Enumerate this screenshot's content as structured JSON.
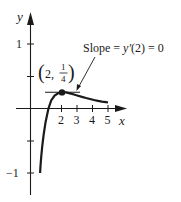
{
  "diagram": {
    "type": "function-graph",
    "function": "y = (x - 1) / x^2",
    "axes": {
      "x_label": "x",
      "y_label": "y",
      "x_ticks": [
        {
          "value": 2,
          "label": "2"
        },
        {
          "value": 3,
          "label": "3"
        },
        {
          "value": 4,
          "label": "4"
        },
        {
          "value": 5,
          "label": "5"
        }
      ],
      "y_ticks": [
        {
          "value": 1,
          "label": "1"
        },
        {
          "value": 0.5,
          "label": ""
        },
        {
          "value": -0.5,
          "label": ""
        },
        {
          "value": -1,
          "label": "−1"
        }
      ],
      "x_range": [
        0,
        5.9
      ],
      "y_range": [
        -1.3,
        1.35
      ]
    },
    "point": {
      "x": 2,
      "y": 0.25,
      "label_prefix": "(2, ",
      "label_num": "1",
      "label_den": "4",
      "label_suffix": ")"
    },
    "annotation": {
      "text_pre": "Slope = ",
      "text_fn": "y′",
      "text_post": "(2) = 0"
    },
    "colors": {
      "ink": "#1a1a1a",
      "background": "#ffffff"
    }
  }
}
